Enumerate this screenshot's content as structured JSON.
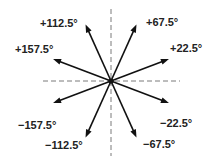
{
  "diagram": {
    "axes": {
      "horizontal": "dashed",
      "vertical": "dashed"
    },
    "colors": {
      "arrow": "#111111",
      "axis": "#7a7a7a",
      "label": "#222222"
    },
    "arrows": [
      {
        "angle_deg": 22.5,
        "label": "+22.5°"
      },
      {
        "angle_deg": 67.5,
        "label": "+67.5°"
      },
      {
        "angle_deg": 112.5,
        "label": "+112.5°"
      },
      {
        "angle_deg": 157.5,
        "label": "+157.5°"
      },
      {
        "angle_deg": -157.5,
        "label": "−157.5°"
      },
      {
        "angle_deg": -112.5,
        "label": "−112.5°"
      },
      {
        "angle_deg": -67.5,
        "label": "−67.5°"
      },
      {
        "angle_deg": -22.5,
        "label": "−22.5°"
      }
    ]
  }
}
